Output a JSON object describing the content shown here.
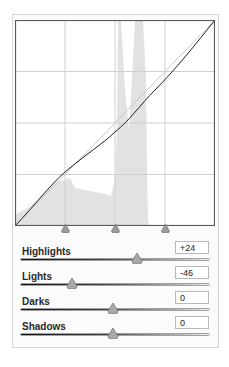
{
  "panel": {
    "title": "Tone Curve",
    "graph": {
      "grid_divisions": 4,
      "split_markers": [
        25,
        50,
        75
      ],
      "curve_color": "#222222",
      "baseline_color": "#c8c8c8",
      "histogram_color": "#e2e2e2"
    },
    "sliders": [
      {
        "label": "Highlights",
        "value": "+24",
        "position": 0.62
      },
      {
        "label": "Lights",
        "value": "-46",
        "position": 0.27
      },
      {
        "label": "Darks",
        "value": "0",
        "position": 0.5
      },
      {
        "label": "Shadows",
        "value": "0",
        "position": 0.5
      }
    ]
  }
}
